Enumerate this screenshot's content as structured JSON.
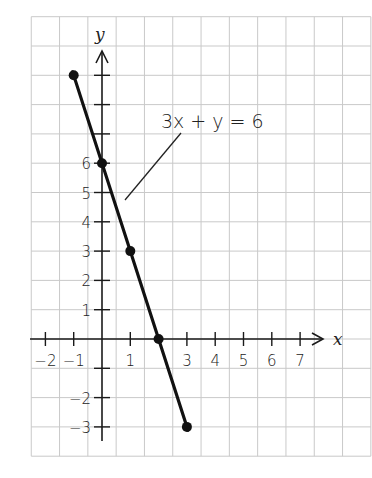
{
  "chart_data": {
    "type": "line",
    "title": "",
    "equation_label": "3x + y = 6",
    "xlabel": "x",
    "ylabel": "y",
    "xlim": [
      -2.5,
      9.5
    ],
    "ylim": [
      -4,
      11
    ],
    "x_ticks": [
      -2,
      -1,
      1,
      3,
      4,
      5,
      6,
      7
    ],
    "x_tick_labels": [
      "−2",
      "−1",
      "1",
      "3",
      "4",
      "5",
      "6",
      "7"
    ],
    "y_ticks": [
      -3,
      -2,
      1,
      2,
      3,
      4,
      5,
      6
    ],
    "y_tick_labels": [
      "−3",
      "−2",
      "1",
      "2",
      "3",
      "4",
      "5",
      "6"
    ],
    "grid": true,
    "series": [
      {
        "name": "3x + y = 6",
        "points": [
          {
            "x": -1,
            "y": 9
          },
          {
            "x": 0,
            "y": 6
          },
          {
            "x": 1,
            "y": 3
          },
          {
            "x": 2,
            "y": 0
          },
          {
            "x": 3,
            "y": -3
          }
        ]
      }
    ],
    "colors": {
      "line": "#111111",
      "grid": "#c9c9c9",
      "axis": "#1a1a1a"
    }
  }
}
